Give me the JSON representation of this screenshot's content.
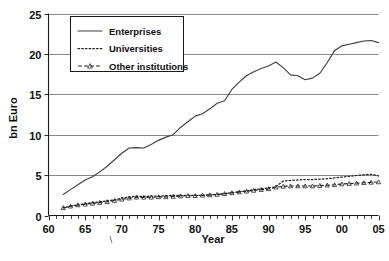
{
  "chart_data": {
    "type": "line",
    "title": "",
    "xlabel": "Year",
    "ylabel": "bn Euro",
    "xlim": [
      60,
      105
    ],
    "ylim": [
      0,
      25
    ],
    "grid": "horizontal",
    "legend_position": "upper-left-inside",
    "y_ticks": [
      "0",
      "5",
      "10",
      "15",
      "20",
      "25"
    ],
    "y_tick_values": [
      0,
      5,
      10,
      15,
      20,
      25
    ],
    "x_ticks": [
      "60",
      "65",
      "70",
      "75",
      "80",
      "85",
      "90",
      "95",
      "00",
      "05"
    ],
    "x_tick_values": [
      60,
      65,
      70,
      75,
      80,
      85,
      90,
      95,
      100,
      105
    ],
    "x_minor_tick_step": 1,
    "x": [
      62,
      63,
      64,
      65,
      66,
      67,
      68,
      69,
      70,
      71,
      72,
      73,
      74,
      75,
      76,
      77,
      78,
      79,
      80,
      81,
      82,
      83,
      84,
      85,
      86,
      87,
      88,
      89,
      90,
      91,
      92,
      93,
      94,
      95,
      96,
      97,
      98,
      99,
      100,
      101,
      102,
      103,
      104,
      105
    ],
    "x_year_labels": [
      "1962",
      "1963",
      "1964",
      "1965",
      "1966",
      "1967",
      "1968",
      "1969",
      "1970",
      "1971",
      "1972",
      "1973",
      "1974",
      "1975",
      "1976",
      "1977",
      "1978",
      "1979",
      "1980",
      "1981",
      "1982",
      "1983",
      "1984",
      "1985",
      "1986",
      "1987",
      "1988",
      "1989",
      "1990",
      "1991",
      "1992",
      "1993",
      "1994",
      "1995",
      "1996",
      "1997",
      "1998",
      "1999",
      "2000",
      "2001",
      "2002",
      "2003",
      "2004",
      "2005"
    ],
    "series": [
      {
        "name": "Enterprises",
        "style": "solid",
        "marker": "none",
        "color": "#3f3f3f",
        "values": [
          2.6,
          3.2,
          3.8,
          4.4,
          4.8,
          5.4,
          6.1,
          6.9,
          7.7,
          8.35,
          8.4,
          8.35,
          8.8,
          9.3,
          9.7,
          10.0,
          10.9,
          11.6,
          12.3,
          12.6,
          13.2,
          13.9,
          14.2,
          15.6,
          16.5,
          17.3,
          17.8,
          18.2,
          18.5,
          19.0,
          18.3,
          17.4,
          17.3,
          16.8,
          17.0,
          17.6,
          18.9,
          20.4,
          21.0,
          21.2,
          21.4,
          21.6,
          21.65,
          21.4
        ]
      },
      {
        "name": "Universities",
        "style": "dotted",
        "marker": "none",
        "color": "#262626",
        "values": [
          0.95,
          1.15,
          1.3,
          1.45,
          1.6,
          1.7,
          1.8,
          1.95,
          2.15,
          2.3,
          2.4,
          2.35,
          2.4,
          2.4,
          2.45,
          2.5,
          2.5,
          2.5,
          2.5,
          2.5,
          2.55,
          2.6,
          2.7,
          2.85,
          2.95,
          3.05,
          3.2,
          3.3,
          3.4,
          3.55,
          4.25,
          4.35,
          4.4,
          4.45,
          4.45,
          4.5,
          4.55,
          4.65,
          4.75,
          4.85,
          4.95,
          5.05,
          5.1,
          4.9
        ]
      },
      {
        "name": "Other institutions",
        "style": "dash-marker",
        "marker": "triangle",
        "color": "#262626",
        "values": [
          0.95,
          1.15,
          1.3,
          1.4,
          1.5,
          1.6,
          1.7,
          1.85,
          2.0,
          2.15,
          2.25,
          2.25,
          2.25,
          2.3,
          2.3,
          2.35,
          2.4,
          2.45,
          2.45,
          2.5,
          2.55,
          2.6,
          2.7,
          2.8,
          2.9,
          3.0,
          3.1,
          3.2,
          3.3,
          3.5,
          3.6,
          3.65,
          3.65,
          3.65,
          3.65,
          3.7,
          3.75,
          3.8,
          3.9,
          3.95,
          4.0,
          4.05,
          4.1,
          4.15
        ]
      }
    ],
    "legend": [
      {
        "label": "Enterprises",
        "style": "solid",
        "marker": "none"
      },
      {
        "label": "Universities",
        "style": "dotted",
        "marker": "none"
      },
      {
        "label": "Other institutions",
        "style": "dash-marker",
        "marker": "triangle"
      }
    ],
    "colors": {
      "axis": "#1a1a1a",
      "grid": "#8a8a8a",
      "series_enterprises": "#3f3f3f",
      "series_universities": "#262626",
      "series_other": "#262626",
      "background": "#ffffff"
    }
  }
}
